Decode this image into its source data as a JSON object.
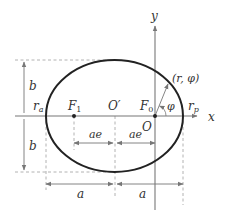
{
  "diagram": {
    "colors": {
      "ellipse": "#222222",
      "axis": "#777777",
      "dashed": "#999999",
      "dimension": "#777777",
      "label": "#333333",
      "background": "#ffffff"
    },
    "labels": {
      "y_axis": "y",
      "x_axis": "x",
      "origin": "O",
      "center": "O′",
      "focus_1": "F",
      "focus_1_sub": "1",
      "focus_0": "F",
      "focus_0_sub": "0",
      "r_apo": "r",
      "r_apo_sub": "a",
      "r_peri": "r",
      "r_peri_sub": "p",
      "point": "(r, φ)",
      "angle": "φ",
      "b_upper": "b",
      "b_lower": "b",
      "ae_left": "ae",
      "ae_right": "ae",
      "a_left": "a",
      "a_right": "a"
    }
  }
}
